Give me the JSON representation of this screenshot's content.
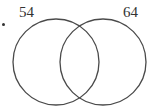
{
  "diagram": {
    "type": "venn",
    "sets": [
      {
        "name": "left-set",
        "label": "54",
        "cx": 56,
        "cy": 62,
        "r": 43
      },
      {
        "name": "right-set",
        "label": "64",
        "cx": 103,
        "cy": 62,
        "r": 43
      }
    ],
    "stroke_color": "#4a4a4a",
    "stroke_width": 1.3,
    "bullet": "•"
  }
}
